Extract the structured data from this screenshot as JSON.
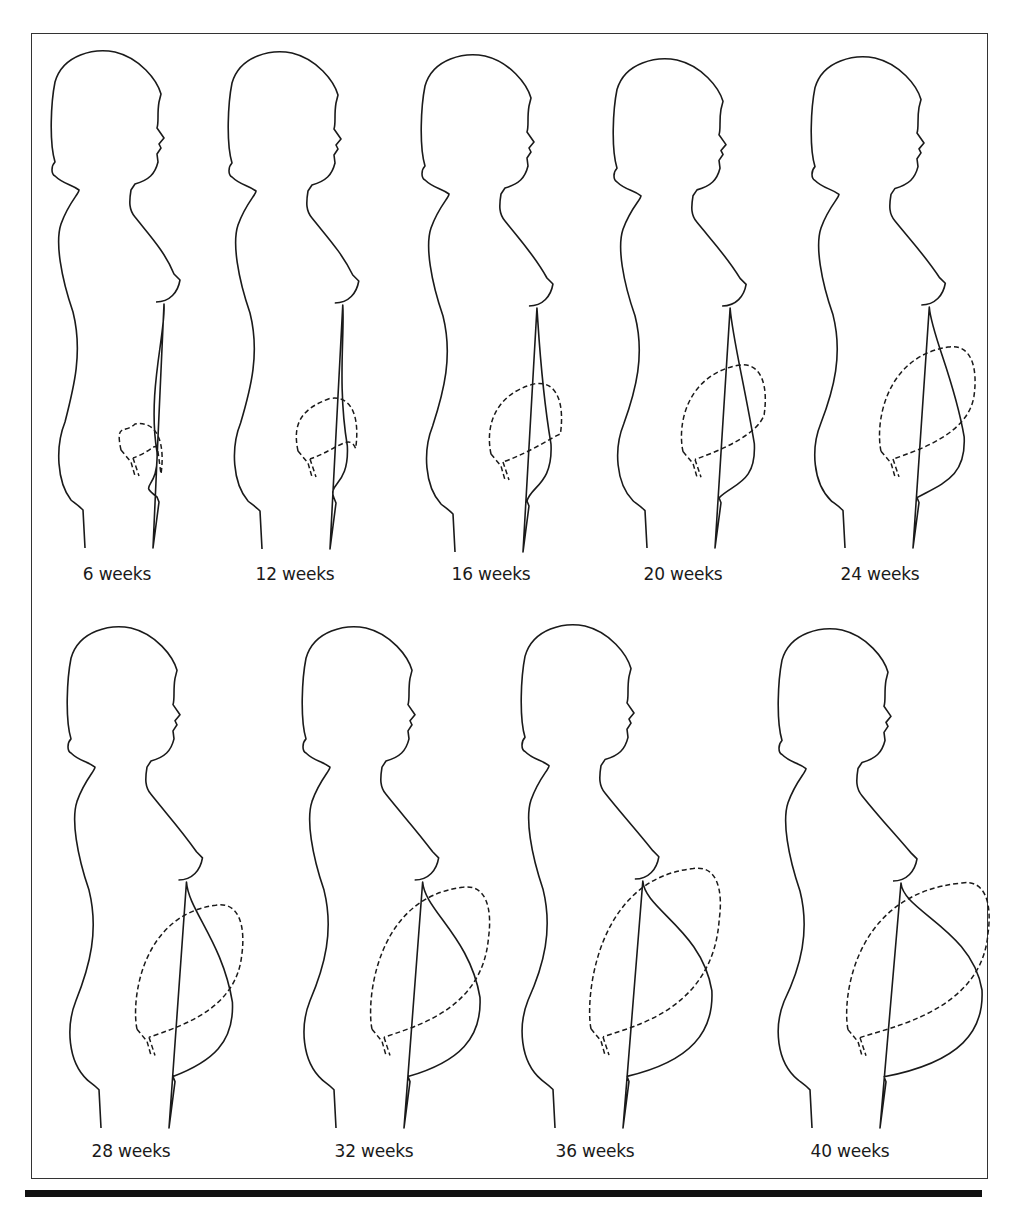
{
  "figure": {
    "rows": [
      {
        "stages": [
          {
            "label": "6 weeks",
            "weeks": 6
          },
          {
            "label": "12 weeks",
            "weeks": 12
          },
          {
            "label": "16 weeks",
            "weeks": 16
          },
          {
            "label": "20 weeks",
            "weeks": 20
          },
          {
            "label": "24 weeks",
            "weeks": 24
          }
        ]
      },
      {
        "stages": [
          {
            "label": "28 weeks",
            "weeks": 28
          },
          {
            "label": "32 weeks",
            "weeks": 32
          },
          {
            "label": "36 weeks",
            "weeks": 36
          },
          {
            "label": "40 weeks",
            "weeks": 40
          }
        ]
      }
    ]
  },
  "colors": {
    "line": "#1a1a1a",
    "background": "#ffffff"
  }
}
